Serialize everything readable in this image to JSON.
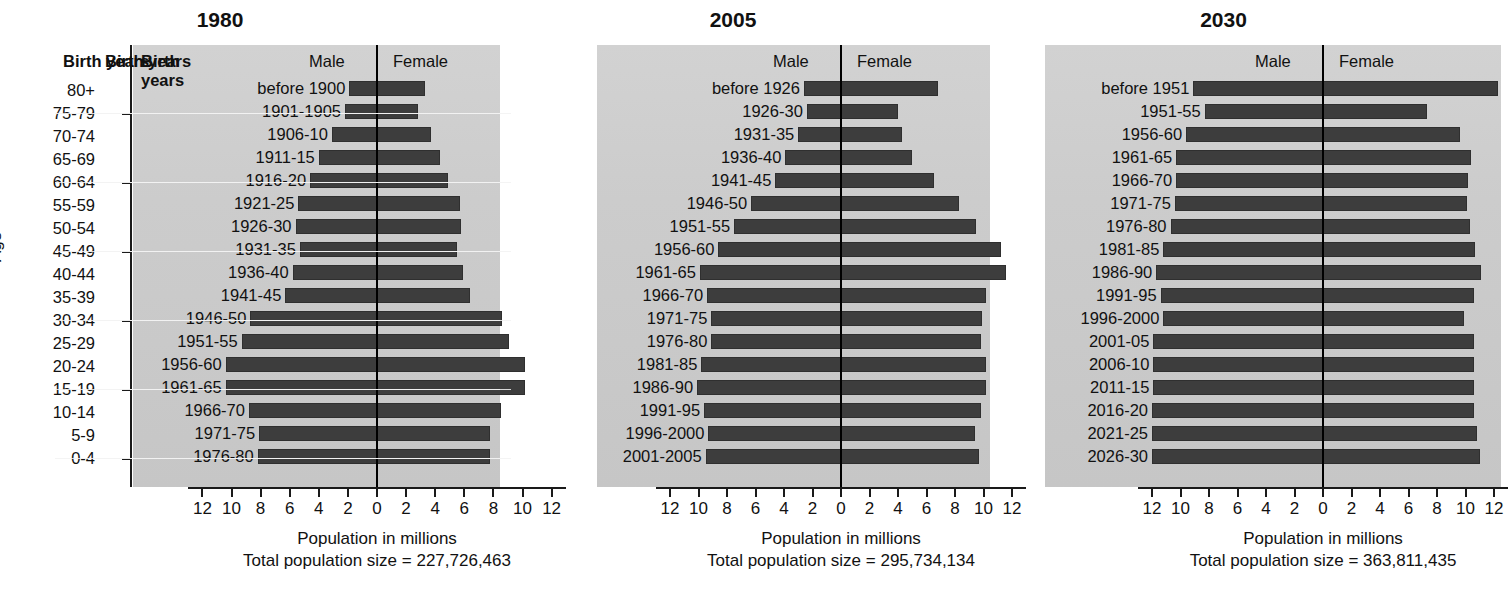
{
  "axis": {
    "age_label": "Age",
    "age_categories": [
      "80+",
      "75-79",
      "70-74",
      "65-69",
      "60-64",
      "55-59",
      "50-54",
      "45-49",
      "40-44",
      "35-39",
      "30-34",
      "25-29",
      "20-24",
      "15-19",
      "10-14",
      "5-9",
      "0-4"
    ],
    "x_tick_labels": [
      "12",
      "10",
      "8",
      "6",
      "4",
      "2",
      "0",
      "2",
      "4",
      "6",
      "8",
      "10",
      "12"
    ],
    "x_axis_title": "Population in millions",
    "xlim_half": 13
  },
  "headers": {
    "birth_years": "Birth years",
    "male": "Male",
    "female": "Female"
  },
  "colors": {
    "bar": "#3d3d3d",
    "plot_background": "#cccccc",
    "axis": "#1a1a1a",
    "gridline": "#f2f2f2"
  },
  "figure_caption": "",
  "chart_data": {
    "type": "bar",
    "subtype": "population-pyramid",
    "xlabel": "Population in millions",
    "ylabel": "Age",
    "categories": [
      "80+",
      "75-79",
      "70-74",
      "65-69",
      "60-64",
      "55-59",
      "50-54",
      "45-49",
      "40-44",
      "35-39",
      "30-34",
      "25-29",
      "20-24",
      "15-19",
      "10-14",
      "5-9",
      "0-4"
    ],
    "xlim": [
      -13,
      13
    ],
    "grid": true,
    "legend": [
      "Male",
      "Female"
    ],
    "legend_position": "top",
    "panels": [
      {
        "title": "1980",
        "total_label": "Total population size = 227,726,463",
        "total_population": 227726463,
        "birth_years": [
          "before 1900",
          "1901-1905",
          "1906-10",
          "1911-15",
          "1916-20",
          "1921-25",
          "1926-30",
          "1931-35",
          "1936-40",
          "1941-45",
          "1946-50",
          "1951-55",
          "1956-60",
          "1961-65",
          "1966-70",
          "1971-75",
          "1976-80"
        ],
        "male": [
          1.9,
          2.2,
          3.1,
          4.0,
          4.6,
          5.4,
          5.6,
          5.3,
          5.8,
          6.3,
          8.7,
          9.3,
          10.4,
          10.4,
          8.8,
          8.1,
          8.2
        ],
        "female": [
          3.3,
          2.8,
          3.7,
          4.3,
          4.9,
          5.7,
          5.8,
          5.5,
          5.9,
          6.4,
          8.6,
          9.1,
          10.2,
          10.2,
          8.5,
          7.8,
          7.8
        ]
      },
      {
        "title": "2005",
        "total_label": "Total population size = 295,734,134",
        "total_population": 295734134,
        "birth_years": [
          "before 1926",
          "1926-30",
          "1931-35",
          "1936-40",
          "1941-45",
          "1946-50",
          "1951-55",
          "1956-60",
          "1961-65",
          "1966-70",
          "1971-75",
          "1976-80",
          "1981-85",
          "1986-90",
          "1991-95",
          "1996-2000",
          "2001-2005"
        ],
        "male": [
          2.6,
          2.4,
          3.0,
          3.9,
          4.6,
          6.3,
          7.5,
          8.6,
          9.9,
          9.4,
          9.1,
          9.1,
          9.8,
          10.1,
          9.6,
          9.3,
          9.5
        ],
        "female": [
          6.8,
          4.0,
          4.3,
          5.0,
          6.5,
          8.3,
          9.5,
          11.2,
          11.6,
          10.2,
          9.9,
          9.8,
          10.2,
          10.2,
          9.8,
          9.4,
          9.7
        ]
      },
      {
        "title": "2030",
        "total_label": "Total population size = 363,811,435",
        "total_population": 363811435,
        "birth_years": [
          "before 1951",
          "1951-55",
          "1956-60",
          "1961-65",
          "1966-70",
          "1971-75",
          "1976-80",
          "1981-85",
          "1986-90",
          "1991-95",
          "1996-2000",
          "2001-05",
          "2006-10",
          "2011-15",
          "2016-20",
          "2021-25",
          "2026-30"
        ],
        "male": [
          9.1,
          8.3,
          9.6,
          10.3,
          10.3,
          10.4,
          10.7,
          11.2,
          11.7,
          11.4,
          11.2,
          11.9,
          11.9,
          11.9,
          12.0,
          12.0,
          12.0
        ],
        "female": [
          12.3,
          7.3,
          9.6,
          10.4,
          10.2,
          10.1,
          10.3,
          10.7,
          11.1,
          10.6,
          9.9,
          10.6,
          10.6,
          10.6,
          10.6,
          10.8,
          11.0
        ]
      }
    ]
  }
}
